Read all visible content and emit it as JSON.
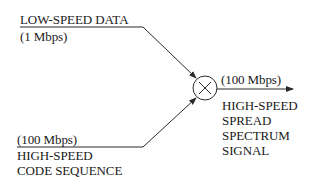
{
  "diagram": {
    "input_data": {
      "title": "LOW-SPEED DATA",
      "rate": "(1 Mbps)"
    },
    "input_code": {
      "rate": "(100 Mbps)",
      "line1": "HIGH-SPEED",
      "line2": "CODE SEQUENCE"
    },
    "mixer": {
      "symbol": "×",
      "icon": "multiplier-icon"
    },
    "output": {
      "rate": "(100 Mbps)",
      "line1": "HIGH-SPEED",
      "line2": "SPREAD",
      "line3": "SPECTRUM",
      "line4": "SIGNAL"
    },
    "colors": {
      "line": "#2a2a2a",
      "text": "#1a1a1a",
      "background": "#ffffff"
    }
  }
}
